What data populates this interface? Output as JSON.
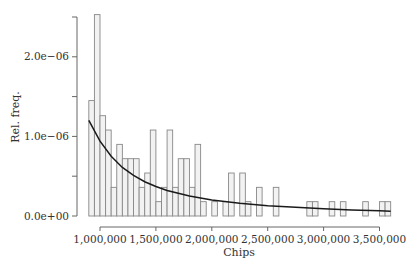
{
  "chart_data": {
    "type": "bar",
    "subtype": "histogram-with-fitted-curve",
    "title": "",
    "xlabel": "Chips",
    "ylabel": "Rel. freq.",
    "xlim": [
      890000,
      3620000
    ],
    "ylim": [
      0,
      2.6e-06
    ],
    "x_ticks": [
      1000000,
      1500000,
      2000000,
      2500000,
      3000000,
      3500000
    ],
    "x_tick_labels": [
      "1,000,000",
      "1,500,000",
      "2,000,000",
      "2,500,000",
      "3,000,000",
      "3,500,000"
    ],
    "y_ticks": [
      0,
      5e-07,
      1e-06,
      1.5e-06,
      2e-06,
      2.5e-06
    ],
    "y_tick_labels": [
      "0.0e+00",
      "",
      "1.0e−06",
      "",
      "2.0e−06",
      ""
    ],
    "grid": false,
    "legend": null,
    "bin_width": 50000,
    "bins": [
      {
        "start": 900000,
        "value": 1.45e-06
      },
      {
        "start": 950000,
        "value": 2.53e-06
      },
      {
        "start": 1000000,
        "value": 1.26e-06
      },
      {
        "start": 1050000,
        "value": 1.08e-06
      },
      {
        "start": 1100000,
        "value": 3.6e-07
      },
      {
        "start": 1150000,
        "value": 9e-07
      },
      {
        "start": 1200000,
        "value": 7.2e-07
      },
      {
        "start": 1250000,
        "value": 7.2e-07
      },
      {
        "start": 1300000,
        "value": 7.2e-07
      },
      {
        "start": 1350000,
        "value": 3.6e-07
      },
      {
        "start": 1400000,
        "value": 5.4e-07
      },
      {
        "start": 1450000,
        "value": 1.08e-06
      },
      {
        "start": 1500000,
        "value": 1.8e-07
      },
      {
        "start": 1550000,
        "value": 3.6e-07
      },
      {
        "start": 1600000,
        "value": 1.08e-06
      },
      {
        "start": 1650000,
        "value": 3.6e-07
      },
      {
        "start": 1700000,
        "value": 7.2e-07
      },
      {
        "start": 1750000,
        "value": 7.2e-07
      },
      {
        "start": 1800000,
        "value": 3.6e-07
      },
      {
        "start": 1850000,
        "value": 9e-07
      },
      {
        "start": 1900000,
        "value": 1.8e-07
      },
      {
        "start": 1950000,
        "value": 0
      },
      {
        "start": 2000000,
        "value": 1.8e-07
      },
      {
        "start": 2050000,
        "value": 0
      },
      {
        "start": 2100000,
        "value": 1.8e-07
      },
      {
        "start": 2150000,
        "value": 5.4e-07
      },
      {
        "start": 2200000,
        "value": 0
      },
      {
        "start": 2250000,
        "value": 5.4e-07
      },
      {
        "start": 2300000,
        "value": 1.8e-07
      },
      {
        "start": 2350000,
        "value": 0
      },
      {
        "start": 2400000,
        "value": 3.6e-07
      },
      {
        "start": 2450000,
        "value": 0
      },
      {
        "start": 2500000,
        "value": 0
      },
      {
        "start": 2550000,
        "value": 3.6e-07
      },
      {
        "start": 2600000,
        "value": 0
      },
      {
        "start": 2650000,
        "value": 0
      },
      {
        "start": 2700000,
        "value": 0
      },
      {
        "start": 2750000,
        "value": 0
      },
      {
        "start": 2800000,
        "value": 0
      },
      {
        "start": 2850000,
        "value": 1.8e-07
      },
      {
        "start": 2900000,
        "value": 1.8e-07
      },
      {
        "start": 2950000,
        "value": 0
      },
      {
        "start": 3000000,
        "value": 0
      },
      {
        "start": 3050000,
        "value": 1.8e-07
      },
      {
        "start": 3100000,
        "value": 0
      },
      {
        "start": 3150000,
        "value": 1.8e-07
      },
      {
        "start": 3200000,
        "value": 0
      },
      {
        "start": 3250000,
        "value": 0
      },
      {
        "start": 3300000,
        "value": 0
      },
      {
        "start": 3350000,
        "value": 1.8e-07
      },
      {
        "start": 3400000,
        "value": 0
      },
      {
        "start": 3450000,
        "value": 0
      },
      {
        "start": 3500000,
        "value": 1.8e-07
      },
      {
        "start": 3550000,
        "value": 1.8e-07
      }
    ],
    "fitted_curve": {
      "name": "fitted density",
      "x": [
        900000,
        1000000,
        1100000,
        1200000,
        1300000,
        1400000,
        1500000,
        1600000,
        1800000,
        2000000,
        2250000,
        2500000,
        2750000,
        3000000,
        3250000,
        3500000,
        3600000
      ],
      "y": [
        1.2e-06,
        9.4e-07,
        7.5e-07,
        6.1e-07,
        5.1e-07,
        4.3e-07,
        3.7e-07,
        3.2e-07,
        2.5e-07,
        2e-07,
        1.6e-07,
        1.3e-07,
        1.1e-07,
        9e-08,
        7.6e-08,
        6.5e-08,
        6.1e-08
      ]
    },
    "colors": {
      "bar_fill": "#f2f2f2",
      "bar_stroke": "#888888",
      "curve": "#1a1a1a",
      "axis": "#666666",
      "text": "#333333"
    }
  }
}
